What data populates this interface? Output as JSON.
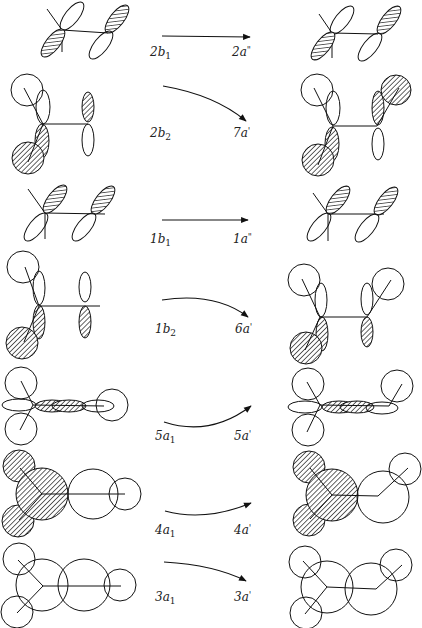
{
  "diagram": {
    "colors": {
      "line": "#111111",
      "hatch": "#111111",
      "background": "#ffffff"
    },
    "rows": [
      {
        "left_label": "2b",
        "left_sub": "1",
        "right_label": "2a",
        "right_sup": "\"",
        "arrow": "straight"
      },
      {
        "left_label": "2b",
        "left_sub": "2",
        "right_label": "7a",
        "right_sup": "'",
        "arrow": "curve-down"
      },
      {
        "left_label": "1b",
        "left_sub": "1",
        "right_label": "1a",
        "right_sup": "\"",
        "arrow": "straight"
      },
      {
        "left_label": "1b",
        "left_sub": "2",
        "right_label": "6a",
        "right_sup": "'",
        "arrow": "curve-down"
      },
      {
        "left_label": "5a",
        "left_sub": "1",
        "right_label": "5a",
        "right_sup": "'",
        "arrow": "curve-up"
      },
      {
        "left_label": "4a",
        "left_sub": "1",
        "right_label": "4a",
        "right_sup": "'",
        "arrow": "curve-up"
      },
      {
        "left_label": "3a",
        "left_sub": "1",
        "right_label": "3a",
        "right_sup": "'",
        "arrow": "curve-down"
      }
    ]
  }
}
